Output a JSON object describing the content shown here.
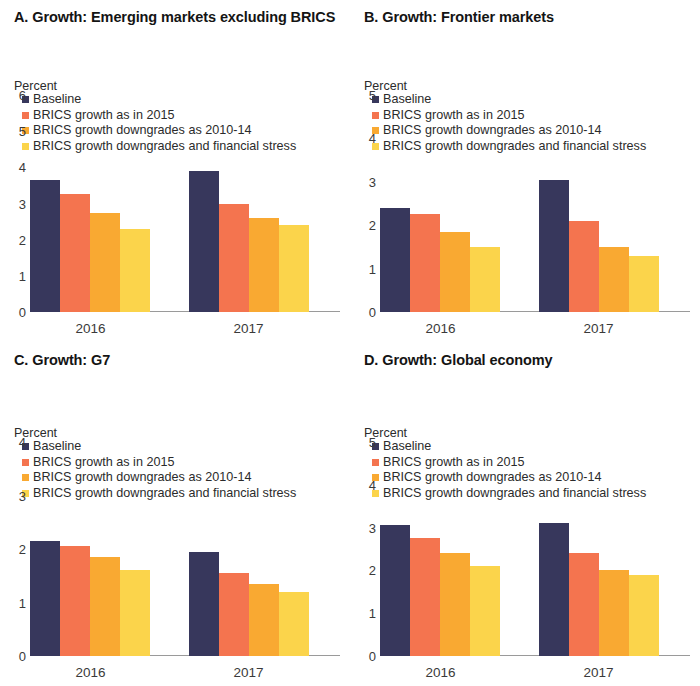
{
  "colors": {
    "baseline": "#37375c",
    "brics_2015": "#f4744f",
    "brics_downgrade": "#f9a932",
    "brics_stress": "#fbd44b",
    "axis": "#9a9a9a",
    "text": "#1a1a1a"
  },
  "series_labels": {
    "baseline": "Baseline",
    "brics_2015": "BRICS growth as in 2015",
    "brics_downgrade": "BRICS growth downgrades as 2010-14",
    "brics_stress": "BRICS growth downgrades and financial stress"
  },
  "unit": "Percent",
  "panels": {
    "a": {
      "title": "A. Growth: Emerging markets excluding BRICS",
      "ymax": 6,
      "yticks": [
        "6",
        "5",
        "4",
        "3",
        "2",
        "1",
        "0"
      ],
      "x0": "2016",
      "x1": "2017"
    },
    "b": {
      "title": "B. Growth: Frontier markets",
      "ymax": 5,
      "yticks": [
        "5",
        "4",
        "3",
        "2",
        "1",
        "0"
      ],
      "x0": "2016",
      "x1": "2017"
    },
    "c": {
      "title": "C. Growth: G7",
      "ymax": 4,
      "yticks": [
        "4",
        "3",
        "2",
        "1",
        "0"
      ],
      "x0": "2016",
      "x1": "2017"
    },
    "d": {
      "title": "D. Growth: Global economy",
      "ymax": 5,
      "yticks": [
        "5",
        "4",
        "3",
        "2",
        "1",
        "0"
      ],
      "x0": "2016",
      "x1": "2017"
    }
  },
  "chart_data": [
    {
      "type": "bar",
      "title": "A. Growth: Emerging markets excluding BRICS",
      "panel": "A",
      "ylabel": "Percent",
      "xlabel": "",
      "ylim": [
        0,
        6
      ],
      "yticks": [
        0,
        1,
        2,
        3,
        4,
        5,
        6
      ],
      "grid": false,
      "legend_position": "top-left",
      "categories": [
        "2016",
        "2017"
      ],
      "series": [
        {
          "name": "Baseline",
          "color": "#37375c",
          "values": [
            3.65,
            3.9
          ]
        },
        {
          "name": "BRICS growth as in 2015",
          "color": "#f4744f",
          "values": [
            3.25,
            3.0
          ]
        },
        {
          "name": "BRICS growth downgrades as 2010-14",
          "color": "#f9a932",
          "values": [
            2.75,
            2.6
          ]
        },
        {
          "name": "BRICS growth downgrades and financial stress",
          "color": "#fbd44b",
          "values": [
            2.3,
            2.4
          ]
        }
      ]
    },
    {
      "type": "bar",
      "title": "B. Growth: Frontier markets",
      "panel": "B",
      "ylabel": "Percent",
      "xlabel": "",
      "ylim": [
        0,
        5
      ],
      "yticks": [
        0,
        1,
        2,
        3,
        4,
        5
      ],
      "grid": false,
      "legend_position": "top-left",
      "categories": [
        "2016",
        "2017"
      ],
      "series": [
        {
          "name": "Baseline",
          "color": "#37375c",
          "values": [
            2.4,
            3.05
          ]
        },
        {
          "name": "BRICS growth as in 2015",
          "color": "#f4744f",
          "values": [
            2.25,
            2.1
          ]
        },
        {
          "name": "BRICS growth downgrades as 2010-14",
          "color": "#f9a932",
          "values": [
            1.85,
            1.5
          ]
        },
        {
          "name": "BRICS growth downgrades and financial stress",
          "color": "#fbd44b",
          "values": [
            1.5,
            1.3
          ]
        }
      ]
    },
    {
      "type": "bar",
      "title": "C. Growth: G7",
      "panel": "C",
      "ylabel": "Percent",
      "xlabel": "",
      "ylim": [
        0,
        4
      ],
      "yticks": [
        0,
        1,
        2,
        3,
        4
      ],
      "grid": false,
      "legend_position": "top-left",
      "categories": [
        "2016",
        "2017"
      ],
      "series": [
        {
          "name": "Baseline",
          "color": "#37375c",
          "values": [
            2.15,
            1.95
          ]
        },
        {
          "name": "BRICS growth as in 2015",
          "color": "#f4744f",
          "values": [
            2.05,
            1.55
          ]
        },
        {
          "name": "BRICS growth downgrades as 2010-14",
          "color": "#f9a932",
          "values": [
            1.85,
            1.35
          ]
        },
        {
          "name": "BRICS growth downgrades and financial stress",
          "color": "#fbd44b",
          "values": [
            1.6,
            1.2
          ]
        }
      ]
    },
    {
      "type": "bar",
      "title": "D. Growth: Global economy",
      "panel": "D",
      "ylabel": "Percent",
      "xlabel": "",
      "ylim": [
        0,
        5
      ],
      "yticks": [
        0,
        1,
        2,
        3,
        4,
        5
      ],
      "grid": false,
      "legend_position": "top-left",
      "categories": [
        "2016",
        "2017"
      ],
      "series": [
        {
          "name": "Baseline",
          "color": "#37375c",
          "values": [
            3.05,
            3.1
          ]
        },
        {
          "name": "BRICS growth as in 2015",
          "color": "#f4744f",
          "values": [
            2.75,
            2.4
          ]
        },
        {
          "name": "BRICS growth downgrades as 2010-14",
          "color": "#f9a932",
          "values": [
            2.4,
            2.0
          ]
        },
        {
          "name": "BRICS growth downgrades and financial stress",
          "color": "#fbd44b",
          "values": [
            2.1,
            1.9
          ]
        }
      ]
    }
  ]
}
